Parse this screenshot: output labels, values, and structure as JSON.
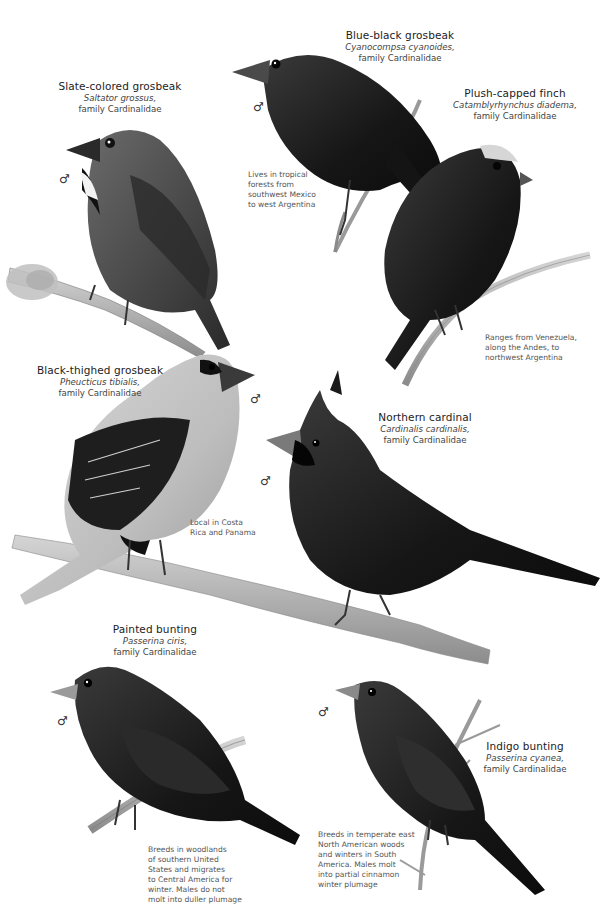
{
  "birds": [
    {
      "id": "slate-colored-grosbeak",
      "common": "Slate-colored grosbeak",
      "scientific": "Saltator grossus,",
      "family": "family Cardinalidae",
      "sex_symbol": "♂",
      "note": ""
    },
    {
      "id": "blue-black-grosbeak",
      "common": "Blue-black grosbeak",
      "scientific": "Cyanocompsa cyanoides,",
      "family": "family Cardinalidae",
      "sex_symbol": "♂",
      "note_lines": [
        "Lives in tropical",
        "forests from",
        "southwest Mexico",
        "to west Argentina"
      ]
    },
    {
      "id": "plush-capped-finch",
      "common": "Plush-capped finch",
      "scientific": "Catamblyrhynchus diadema,",
      "family": "family Cardinalidae",
      "sex_symbol": "",
      "note_lines": [
        "Ranges from Venezuela,",
        "along the Andes, to",
        "northwest Argentina"
      ]
    },
    {
      "id": "black-thighed-grosbeak",
      "common": "Black-thighed grosbeak",
      "scientific": "Pheucticus tibialis,",
      "family": "family Cardinalidae",
      "sex_symbol": "♂",
      "note_lines": [
        "Local in Costa",
        "Rica and Panama"
      ]
    },
    {
      "id": "northern-cardinal",
      "common": "Northern cardinal",
      "scientific": "Cardinalis cardinalis,",
      "family": "family Cardinalidae",
      "sex_symbol": "♂"
    },
    {
      "id": "painted-bunting",
      "common": "Painted bunting",
      "scientific": "Passerina ciris,",
      "family": "family Cardinalidae",
      "sex_symbol": "♂",
      "note_lines": [
        "Breeds in woodlands",
        "of southern United",
        "States and migrates",
        "to Central America for",
        "winter. Males do not",
        "molt into duller plumage"
      ]
    },
    {
      "id": "indigo-bunting",
      "common": "Indigo bunting",
      "scientific": "Passerina cyanea,",
      "family": "family Cardinalidae",
      "sex_symbol": "♂",
      "note_lines": [
        "Breeds in temperate east",
        "North American woods",
        "and winters in South",
        "America. Males molt",
        "into partial cinnamon",
        "winter plumage"
      ]
    }
  ],
  "colors": {
    "background": "#ffffff",
    "ink_dark": "#1a1a1a",
    "ink_mid": "#555555",
    "branch": "#9a9a9a"
  }
}
